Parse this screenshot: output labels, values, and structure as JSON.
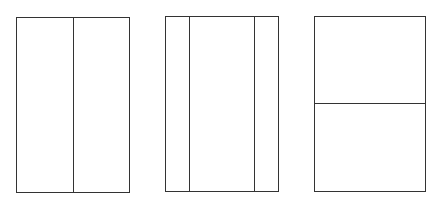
{
  "diagram": {
    "stroke_color": "#333333",
    "background_color": "#ffffff",
    "panels": [
      {
        "name": "two-vertical-halves",
        "divisions": "vertical",
        "parts": 2
      },
      {
        "name": "three-vertical-strips",
        "divisions": "vertical",
        "parts": 3
      },
      {
        "name": "two-horizontal-halves",
        "divisions": "horizontal",
        "parts": 2
      }
    ]
  }
}
